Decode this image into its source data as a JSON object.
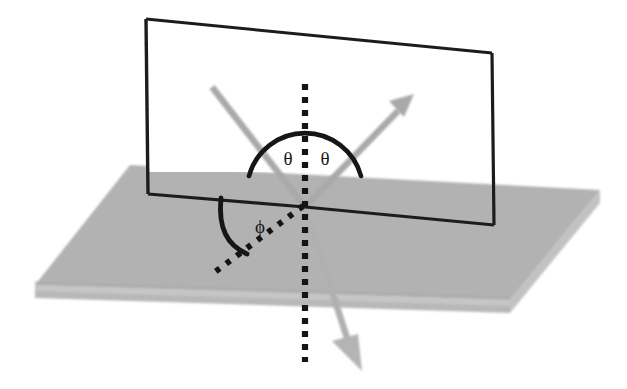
{
  "figure": {
    "background_color": "#ffffff"
  },
  "colors": {
    "surface_fill": "#b2b2b2",
    "surface_edge_fill": "#a3a3a3",
    "surface_side_fill": "#bcbcbc",
    "ray_gray": "#a8a8a8",
    "ray_gray_light": "#bdbdbd",
    "line_black": "#1a1a1a",
    "label_black": "#1a1a1a",
    "plane_fill": "#ffffff"
  },
  "labels": {
    "theta_incident": "θ",
    "theta_reflected": "θ",
    "phi_azimuth": "ϕ"
  },
  "elements": {
    "surface_plane": "horizontal-gray-slab",
    "incidence_plane": "vertical-rectangular-plane",
    "normal_line": "vertical-dotted-normal",
    "incident_ray": "incoming-gray-ray",
    "reflected_ray": "outgoing-gray-arrow-up-right",
    "refracted_ray": "outgoing-gray-arrow-down-right",
    "azimuth_line": "dotted-diagonal-in-surface",
    "theta_arc": "black-semicircular-arc",
    "phi_arc": "black-quarter-arc"
  },
  "geometry": {
    "origin": {
      "x": 305,
      "y": 207
    },
    "slab": {
      "top_face": "35,285 130,165 600,190 510,300",
      "thickness_px": 13
    },
    "vertical_plane": {
      "top_left": "146,19",
      "top_right": "492,53",
      "bottom_right": "494,225",
      "bottom_left": "148,194"
    },
    "normal": {
      "x": 305,
      "y_top": 84,
      "y_bottom": 362
    },
    "incident_ray": {
      "from_x": 212,
      "from_y": 87,
      "to_x": 305,
      "to_y": 207
    },
    "reflected_ray": {
      "from_x": 305,
      "from_y": 207,
      "to_x": 412,
      "to_y": 96
    },
    "refracted_ray": {
      "from_x": 305,
      "from_y": 207,
      "to_x": 358,
      "to_y": 368
    },
    "azimuth_dotted": {
      "from_x": 305,
      "from_y": 207,
      "to_x": 213,
      "to_y": 273
    },
    "theta_arc_radius": 56,
    "phi_arc_radius": 62
  }
}
